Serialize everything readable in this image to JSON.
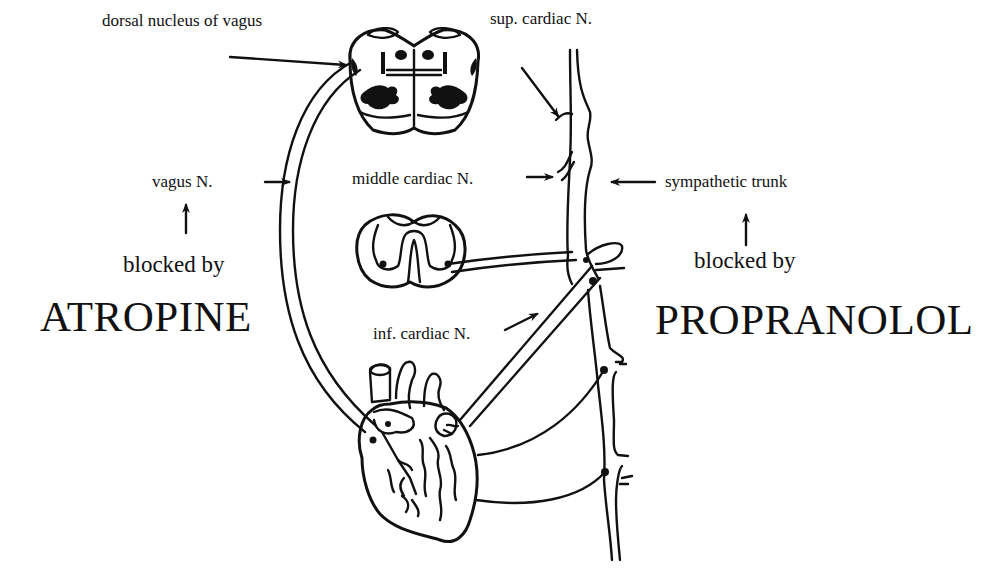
{
  "diagram": {
    "colors": {
      "ink": "#111111",
      "background": "#ffffff"
    },
    "labels": {
      "dorsal_nucleus": "dorsal nucleus of vagus",
      "sup_cardiac": "sup. cardiac N.",
      "vagus": "vagus N.",
      "middle_cardiac": "middle cardiac N.",
      "sympathetic_trunk": "sympathetic trunk",
      "blocked_by_left": "blocked by",
      "blocked_by_right": "blocked by",
      "atropine": "ATROPINE",
      "propranolol": "PROPRANOLOL",
      "inf_cardiac": "inf. cardiac N."
    },
    "structures": [
      {
        "id": "medulla-section",
        "name": "Brainstem (medulla) cross-section",
        "position": "top-center"
      },
      {
        "id": "spinal-cord-section",
        "name": "Thoracic spinal cord cross-section",
        "position": "center"
      },
      {
        "id": "vagus-nerve",
        "name": "Vagus nerve",
        "path": "medulla to heart, left arc"
      },
      {
        "id": "sympathetic-chain",
        "name": "Sympathetic trunk with ganglia",
        "position": "right vertical"
      },
      {
        "id": "heart",
        "name": "Heart",
        "position": "bottom-center"
      }
    ],
    "relations": [
      {
        "drug": "ATROPINE",
        "blocks": "vagus N."
      },
      {
        "drug": "PROPRANOLOL",
        "blocks": "sympathetic trunk"
      }
    ]
  }
}
